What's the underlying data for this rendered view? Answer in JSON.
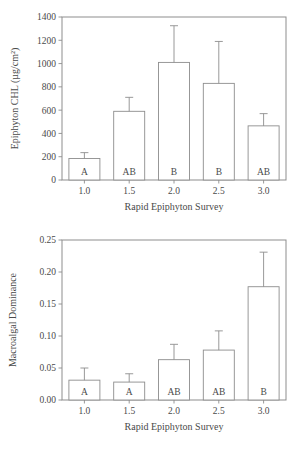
{
  "figure": {
    "background": "#ffffff",
    "line_color": "#8d8d8d",
    "text_color": "#4a4a4a",
    "bar_fill": "#ffffff"
  },
  "chart_data": [
    {
      "type": "bar",
      "panel": "top",
      "title": "",
      "xlabel": "Rapid Epiphyton Survey",
      "ylabel": "Epiphyton CHL (µg/cm²)",
      "categories": [
        "1.0",
        "1.5",
        "2.0",
        "2.5",
        "3.0"
      ],
      "values": [
        185,
        590,
        1010,
        830,
        465
      ],
      "error_high": [
        235,
        710,
        1325,
        1190,
        570
      ],
      "annotations": [
        "A",
        "AB",
        "B",
        "B",
        "AB"
      ],
      "ylim": [
        0,
        1400
      ],
      "yticks": [
        0,
        200,
        400,
        600,
        800,
        1000,
        1200,
        1400
      ],
      "ytick_labels": [
        "0",
        "200",
        "400",
        "600",
        "800",
        "1000",
        "1200",
        "1400"
      ],
      "grid": false,
      "legend": "none"
    },
    {
      "type": "bar",
      "panel": "bottom",
      "title": "",
      "xlabel": "Rapid Epiphyton Survey",
      "ylabel": "Macroalgal Dominance",
      "categories": [
        "1.0",
        "1.5",
        "2.0",
        "2.5",
        "3.0"
      ],
      "values": [
        0.031,
        0.028,
        0.063,
        0.078,
        0.177
      ],
      "error_high": [
        0.05,
        0.041,
        0.087,
        0.108,
        0.231
      ],
      "annotations": [
        "A",
        "A",
        "AB",
        "AB",
        "B"
      ],
      "ylim": [
        0.0,
        0.25
      ],
      "yticks": [
        0.0,
        0.05,
        0.1,
        0.15,
        0.2,
        0.25
      ],
      "ytick_labels": [
        "0.00",
        "0.05",
        "0.10",
        "0.15",
        "0.20",
        "0.25"
      ],
      "grid": false,
      "legend": "none"
    }
  ]
}
